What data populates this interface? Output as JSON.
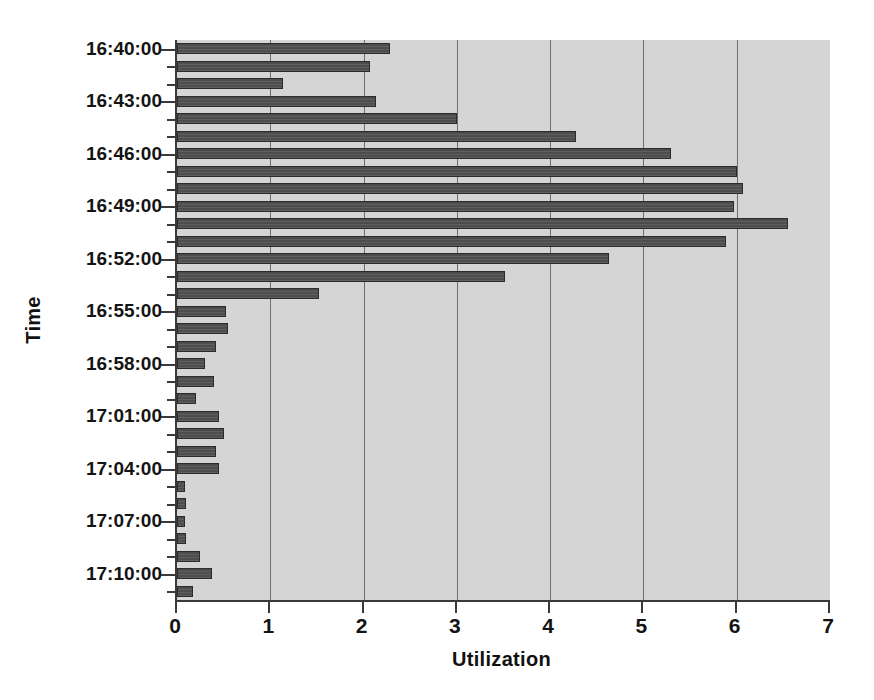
{
  "chart_data": {
    "type": "bar",
    "orientation": "horizontal",
    "title": "",
    "xlabel": "Utilization",
    "ylabel": "Time",
    "xlim": [
      0,
      7
    ],
    "xticks": [
      0,
      1,
      2,
      3,
      4,
      5,
      6,
      7
    ],
    "xticklabels": [
      "0",
      "1",
      "2",
      "3",
      "4",
      "5",
      "6",
      "7"
    ],
    "grid": "vertical",
    "legend": "none",
    "plot_background": "#d5d5d5",
    "bar_color": "#4d4d4d",
    "axis_color": "#3a3a3a",
    "ytick_labels": [
      "16:40:00",
      "16:43:00",
      "16:46:00",
      "16:49:00",
      "16:52:00",
      "16:55:00",
      "16:58:00",
      "17:01:00",
      "17:04:00",
      "17:07:00",
      "17:10:00"
    ],
    "ytick_label_interval_minutes": 3,
    "categories": [
      "16:40:00",
      "16:41:00",
      "16:42:00",
      "16:43:00",
      "16:44:00",
      "16:45:00",
      "16:46:00",
      "16:47:00",
      "16:48:00",
      "16:49:00",
      "16:50:00",
      "16:51:00",
      "16:52:00",
      "16:53:00",
      "16:54:00",
      "16:55:00",
      "16:56:00",
      "16:57:00",
      "16:58:00",
      "16:59:00",
      "17:00:00",
      "17:01:00",
      "17:02:00",
      "17:03:00",
      "17:04:00",
      "17:05:00",
      "17:06:00",
      "17:07:00",
      "17:08:00",
      "17:09:00",
      "17:10:00",
      "17:11:00"
    ],
    "values": [
      2.28,
      2.07,
      1.14,
      2.13,
      3.0,
      4.28,
      5.3,
      6.0,
      6.07,
      5.97,
      6.55,
      5.88,
      4.63,
      3.52,
      1.52,
      0.53,
      0.55,
      0.42,
      0.3,
      0.4,
      0.2,
      0.45,
      0.5,
      0.42,
      0.45,
      0.09,
      0.1,
      0.09,
      0.1,
      0.25,
      0.38,
      0.17
    ]
  }
}
